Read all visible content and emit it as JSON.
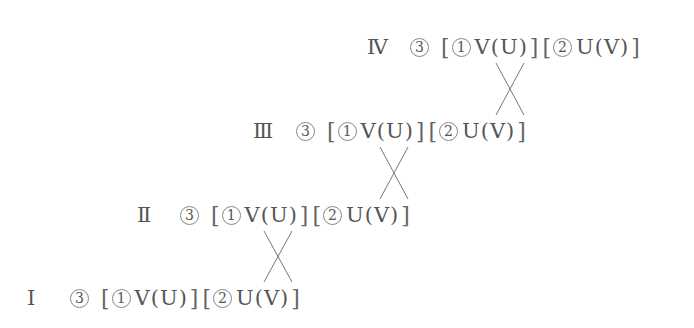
{
  "diagram": {
    "rows": [
      {
        "level": "Ⅳ",
        "step": "3",
        "groups": [
          {
            "num": "1",
            "expr": "V(U)"
          },
          {
            "num": "2",
            "expr": "U(V)"
          }
        ]
      },
      {
        "level": "Ⅲ",
        "step": "3",
        "groups": [
          {
            "num": "1",
            "expr": "V(U)"
          },
          {
            "num": "2",
            "expr": "U(V)"
          }
        ]
      },
      {
        "level": "Ⅱ",
        "step": "3",
        "groups": [
          {
            "num": "1",
            "expr": "V(U)"
          },
          {
            "num": "2",
            "expr": "U(V)"
          }
        ]
      },
      {
        "level": "Ⅰ",
        "step": "3",
        "groups": [
          {
            "num": "1",
            "expr": "V(U)"
          },
          {
            "num": "2",
            "expr": "U(V)"
          }
        ]
      }
    ],
    "connections": [
      {
        "from": "Ⅳ.group1",
        "to": "Ⅲ.group2",
        "type": "cross"
      },
      {
        "from": "Ⅲ.group1",
        "to": "Ⅱ.group2",
        "type": "cross"
      },
      {
        "from": "Ⅱ.group1",
        "to": "Ⅰ.group2",
        "type": "cross"
      }
    ],
    "line_color": "#777777"
  }
}
